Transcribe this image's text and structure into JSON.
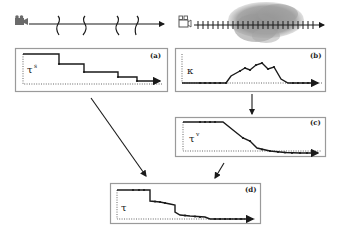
{
  "top_left_timeline": {
    "camera_icon": "video-camera-icon",
    "cut_marks": 4,
    "description": "Sparse shot boundaries (wavy cut marks) on a time axis"
  },
  "top_right_timeline": {
    "camera_icon": "video-camera-icon",
    "tick_marks": 24,
    "cloud": "motion-blob",
    "description": "Dense frame ticks with cloud of activity over the middle"
  },
  "panels": [
    {
      "id": "a",
      "label": "(a)",
      "symbol": "τ",
      "superscript": "s",
      "type": "step-down"
    },
    {
      "id": "b",
      "label": "(b)",
      "symbol": "κ",
      "superscript": "",
      "type": "bump"
    },
    {
      "id": "c",
      "label": "(c)",
      "symbol": "τ",
      "superscript": "v",
      "type": "smooth-decay"
    },
    {
      "id": "d",
      "label": "(d)",
      "symbol": "τ",
      "superscript": "",
      "type": "combined-decay"
    }
  ],
  "arrows": [
    {
      "from": "a",
      "to": "d"
    },
    {
      "from": "b",
      "to": "c"
    },
    {
      "from": "c",
      "to": "d"
    }
  ]
}
